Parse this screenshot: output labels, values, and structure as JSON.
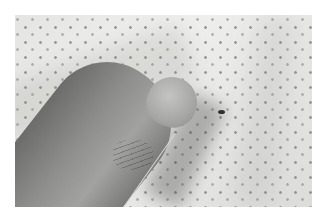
{
  "image": {
    "description": "Grayscale photo of a thumb pressing on white fabric printed with small gray dots; a small dark speck sits just right of the thumbnail and a thin light filament runs diagonally across the thumb.",
    "colors": {
      "background": "#ffffff",
      "fabric": "#e8e8e6",
      "dots": "#8a8a88",
      "skin": "#8e8e8c",
      "speck": "#303030"
    }
  }
}
